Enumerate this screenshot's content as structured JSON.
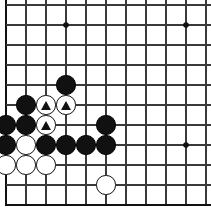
{
  "board": {
    "kind": "go-board-diagram",
    "title": "Go board position diagram",
    "columns": 11,
    "rows": 11,
    "origin_x": 6,
    "origin_y": 5,
    "spacing": 20,
    "stone_radius": 9.6,
    "line_color": "#3a3a3a",
    "edge_color": "#111111",
    "black_color": "#111111",
    "white_color": "#ffffff",
    "mark_color": "#111111",
    "background_color": "#ffffff",
    "star_points": [
      {
        "col": 3,
        "row": 1
      },
      {
        "col": 9,
        "row": 1
      },
      {
        "col": 9,
        "row": 7
      }
    ],
    "edges": {
      "left": true,
      "bottom": true,
      "top": false,
      "right": false
    },
    "stones": [
      {
        "col": 3,
        "row": 4,
        "color": "black",
        "mark": ""
      },
      {
        "col": 1,
        "row": 5,
        "color": "black",
        "mark": ""
      },
      {
        "col": 2,
        "row": 5,
        "color": "white",
        "mark": "triangle"
      },
      {
        "col": 3,
        "row": 5,
        "color": "white",
        "mark": "triangle"
      },
      {
        "col": 0,
        "row": 6,
        "color": "black",
        "mark": ""
      },
      {
        "col": 1,
        "row": 6,
        "color": "black",
        "mark": ""
      },
      {
        "col": 2,
        "row": 6,
        "color": "white",
        "mark": "triangle"
      },
      {
        "col": 5,
        "row": 6,
        "color": "black",
        "mark": ""
      },
      {
        "col": 0,
        "row": 7,
        "color": "black",
        "mark": ""
      },
      {
        "col": 1,
        "row": 7,
        "color": "white",
        "mark": ""
      },
      {
        "col": 2,
        "row": 7,
        "color": "black",
        "mark": ""
      },
      {
        "col": 3,
        "row": 7,
        "color": "black",
        "mark": ""
      },
      {
        "col": 4,
        "row": 7,
        "color": "black",
        "mark": ""
      },
      {
        "col": 5,
        "row": 7,
        "color": "black",
        "mark": ""
      },
      {
        "col": 0,
        "row": 8,
        "color": "white",
        "mark": ""
      },
      {
        "col": 1,
        "row": 8,
        "color": "white",
        "mark": ""
      },
      {
        "col": 2,
        "row": 8,
        "color": "white",
        "mark": ""
      },
      {
        "col": 5,
        "row": 9,
        "color": "white",
        "mark": ""
      }
    ]
  }
}
